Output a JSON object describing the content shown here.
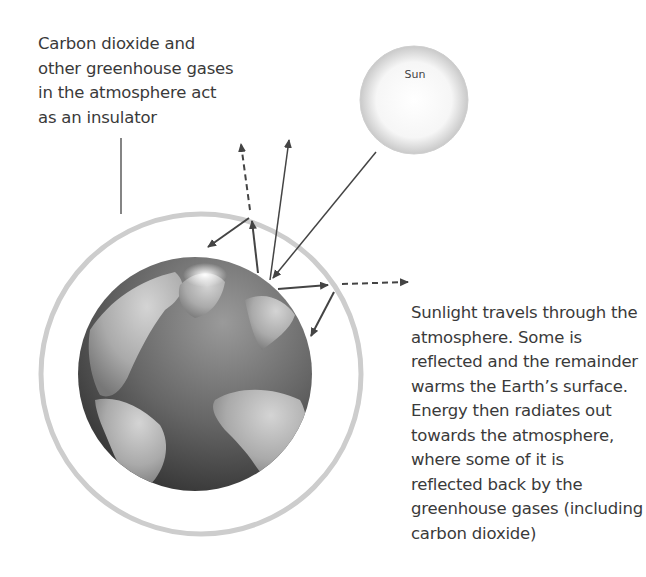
{
  "diagram": {
    "labels": {
      "insulator": "Carbon dioxide and\nother greenhouse gases\nin the atmosphere act\nas an insulator",
      "sun": "Sun",
      "description": "Sunlight travels through the\natmosphere. Some is\nreflected and the remainder\nwarms the Earth’s surface.\nEnergy then radiates out\ntowards the atmosphere,\nwhere some of it is\nreflected back by the\ngreenhouse gases (including\ncarbon dioxide)"
    },
    "elements": {
      "sun": {
        "shape": "circle",
        "color": "#d8d8d8"
      },
      "earth": {
        "shape": "globe",
        "color": "#6a6a6a"
      },
      "atmosphere": {
        "shape": "ring",
        "color": "#c8c8c8"
      },
      "arrows": [
        {
          "type": "solid",
          "meaning": "incoming sunlight"
        },
        {
          "type": "solid",
          "meaning": "reflected sunlight"
        },
        {
          "type": "solid",
          "meaning": "radiated energy"
        },
        {
          "type": "dashed",
          "meaning": "energy escaping to space"
        },
        {
          "type": "solid",
          "meaning": "energy reflected back by greenhouse gases"
        }
      ]
    },
    "colors": {
      "arrow": "#444444",
      "text": "#3a3a3a"
    }
  }
}
